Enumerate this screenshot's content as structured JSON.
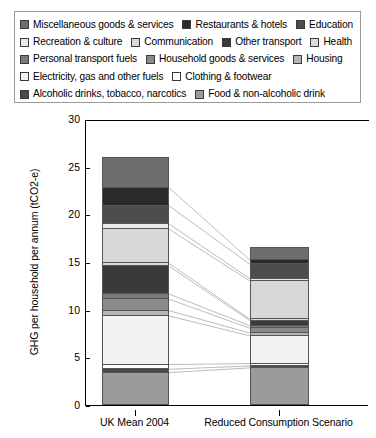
{
  "legend": {
    "rows": [
      [
        {
          "label": "Miscellaneous goods & services",
          "color": "#6e6e6e"
        },
        {
          "label": "Restaurants & hotels",
          "color": "#2a2a2a"
        },
        {
          "label": "Education",
          "color": "#4d4d4d"
        }
      ],
      [
        {
          "label": "Recreation & culture",
          "color": "#e8e8e8"
        },
        {
          "label": "Communication",
          "color": "#d8d8d8"
        },
        {
          "label": "Other transport",
          "color": "#3a3a3a"
        },
        {
          "label": "Health",
          "color": "#dcdcdc"
        }
      ],
      [
        {
          "label": "Personal transport fuels",
          "color": "#7a7a7a"
        },
        {
          "label": "Household goods & services",
          "color": "#8a8a8a"
        },
        {
          "label": "Housing",
          "color": "#b5b5b5"
        }
      ],
      [
        {
          "label": "Electricity, gas and other fuels",
          "color": "#f2f2f2"
        },
        {
          "label": "Clothing & footwear",
          "color": "#ffffff"
        }
      ],
      [
        {
          "label": "Alcoholic drinks, tobacco, narcotics",
          "color": "#4a4a4a"
        },
        {
          "label": "Food & non-alcoholic drink",
          "color": "#9b9b9b"
        }
      ]
    ]
  },
  "chart_data": {
    "type": "bar",
    "stacked": true,
    "title": "",
    "xlabel": "",
    "ylabel": "GHG per household per annum (tCO2-e)",
    "ylim": [
      0,
      30
    ],
    "yticks": [
      0,
      5,
      10,
      15,
      20,
      25,
      30
    ],
    "grid": false,
    "legend_position": "top",
    "categories": [
      "UK Mean 2004",
      "Reduced Consumption Scenario"
    ],
    "series": [
      {
        "name": "Food & non-alcoholic drink",
        "color": "#9b9b9b",
        "values": [
          3.5,
          4.0
        ]
      },
      {
        "name": "Alcoholic drinks, tobacco, narcotics",
        "color": "#4a4a4a",
        "values": [
          0.35,
          0.2
        ]
      },
      {
        "name": "Clothing & footwear",
        "color": "#ffffff",
        "values": [
          0.5,
          0.25
        ]
      },
      {
        "name": "Electricity, gas and other fuels",
        "color": "#f2f2f2",
        "values": [
          5.1,
          2.9
        ]
      },
      {
        "name": "Housing",
        "color": "#b5b5b5",
        "values": [
          0.55,
          0.3
        ]
      },
      {
        "name": "Household goods & services",
        "color": "#8a8a8a",
        "values": [
          1.2,
          0.5
        ]
      },
      {
        "name": "Personal transport fuels",
        "color": "#7a7a7a",
        "values": [
          0.55,
          0.25
        ]
      },
      {
        "name": "Other transport",
        "color": "#3a3a3a",
        "values": [
          2.9,
          0.55
        ]
      },
      {
        "name": "Health",
        "color": "#dcdcdc",
        "values": [
          0.3,
          0.15
        ]
      },
      {
        "name": "Communication",
        "color": "#d8d8d8",
        "values": [
          3.6,
          4.0
        ]
      },
      {
        "name": "Recreation & culture",
        "color": "#e8e8e8",
        "values": [
          0.55,
          0.25
        ]
      },
      {
        "name": "Education",
        "color": "#4d4d4d",
        "values": [
          1.9,
          1.5
        ]
      },
      {
        "name": "Restaurants & hotels",
        "color": "#2a2a2a",
        "values": [
          1.9,
          0.45
        ]
      },
      {
        "name": "Miscellaneous goods & services",
        "color": "#6e6e6e",
        "values": [
          3.1,
          1.3
        ]
      }
    ],
    "totals": [
      26.0,
      16.6
    ]
  }
}
